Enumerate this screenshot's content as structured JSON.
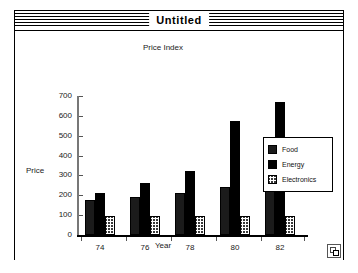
{
  "window": {
    "title": "Untitled",
    "grow_box_icon": "resize-grow-box-icon"
  },
  "chart_data": {
    "type": "bar",
    "title": "Price Index",
    "xlabel": "Year",
    "ylabel": "Price",
    "categories": [
      "74",
      "76",
      "78",
      "80",
      "82"
    ],
    "series": [
      {
        "name": "Food",
        "values": [
          175,
          190,
          210,
          240,
          245
        ],
        "fill": "solid-black",
        "color": "#1b1b1b"
      },
      {
        "name": "Energy",
        "values": [
          210,
          260,
          320,
          575,
          670
        ],
        "fill": "dark-checker",
        "color": "#4a4a4a"
      },
      {
        "name": "Electronics",
        "values": [
          95,
          95,
          95,
          95,
          95
        ],
        "fill": "light-stipple",
        "color": "#b0b0b0"
      }
    ],
    "ylim": [
      0,
      700
    ],
    "yticks": [
      0,
      100,
      200,
      300,
      400,
      500,
      600,
      700
    ],
    "grid": false,
    "legend_position": "right"
  }
}
